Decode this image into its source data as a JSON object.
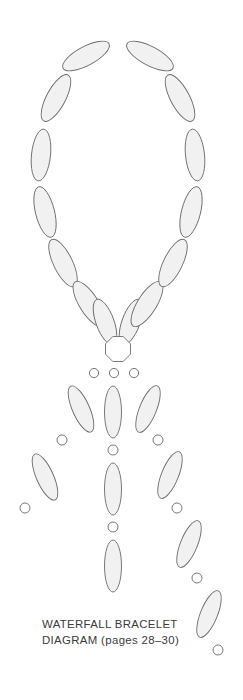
{
  "document": {
    "title": "Waterfall Bracelet Diagram",
    "background_color": "#ffffff",
    "width": 243,
    "height": 700
  },
  "caption": {
    "line1": "WATERFALL BRACELET",
    "line2": "DIAGRAM (pages 28–30)",
    "color": "#3b3b3b"
  },
  "style": {
    "bead_fill": "#f1f1f1",
    "bead_stroke": "#6b6b6b",
    "bead_stroke_width": 0.9,
    "seed_fill": "#ffffff",
    "seed_stroke": "#6b6b6b",
    "seed_stroke_width": 0.9,
    "clasp_fill": "#ffffff",
    "clasp_stroke": "#6b6b6b",
    "clasp_stroke_width": 0.9
  },
  "diagram": {
    "name": "waterfall-bracelet",
    "loop": {
      "name": "teardrop-loop",
      "bead_count": 14,
      "beads": [
        {
          "cx": 86,
          "cy": 56,
          "rx": 9.5,
          "ry": 26,
          "angle": 62
        },
        {
          "cx": 56,
          "cy": 98,
          "rx": 9.5,
          "ry": 26,
          "angle": 28
        },
        {
          "cx": 41,
          "cy": 155,
          "rx": 9.5,
          "ry": 26,
          "angle": 6
        },
        {
          "cx": 45,
          "cy": 212,
          "rx": 9.5,
          "ry": 26,
          "angle": -14
        },
        {
          "cx": 63,
          "cy": 263,
          "rx": 9.5,
          "ry": 26,
          "angle": -26
        },
        {
          "cx": 89,
          "cy": 304,
          "rx": 9.5,
          "ry": 26,
          "angle": -32
        },
        {
          "cx": 105,
          "cy": 322,
          "rx": 9.0,
          "ry": 24,
          "angle": -20
        },
        {
          "cx": 131,
          "cy": 322,
          "rx": 9.0,
          "ry": 24,
          "angle": 20
        },
        {
          "cx": 147,
          "cy": 304,
          "rx": 9.5,
          "ry": 26,
          "angle": 32
        },
        {
          "cx": 173,
          "cy": 263,
          "rx": 9.5,
          "ry": 26,
          "angle": 26
        },
        {
          "cx": 191,
          "cy": 212,
          "rx": 9.5,
          "ry": 26,
          "angle": 14
        },
        {
          "cx": 195,
          "cy": 155,
          "rx": 9.5,
          "ry": 26,
          "angle": -6
        },
        {
          "cx": 180,
          "cy": 98,
          "rx": 9.5,
          "ry": 26,
          "angle": -28
        },
        {
          "cx": 150,
          "cy": 56,
          "rx": 9.5,
          "ry": 26,
          "angle": -62
        }
      ]
    },
    "clasp": {
      "name": "octagon-clasp-bead",
      "cx": 118,
      "cy": 349,
      "radius": 13.5,
      "sides": 8,
      "rotation": 22.5
    },
    "strands": [
      {
        "name": "left-strand",
        "seed_top": {
          "cx": 94,
          "cy": 373,
          "r": 4.6
        },
        "items": [
          {
            "type": "bead",
            "cx": 81,
            "cy": 409,
            "rx": 8.5,
            "ry": 25,
            "angle": -24
          },
          {
            "type": "seed",
            "cx": 62,
            "cy": 440,
            "r": 5.0
          },
          {
            "type": "bead",
            "cx": 45,
            "cy": 477,
            "rx": 8.5,
            "ry": 25,
            "angle": -24
          },
          {
            "type": "seed",
            "cx": 25,
            "cy": 508,
            "r": 5.0
          }
        ]
      },
      {
        "name": "center-strand",
        "seed_top": {
          "cx": 114,
          "cy": 373,
          "r": 4.6
        },
        "items": [
          {
            "type": "bead",
            "cx": 113,
            "cy": 412,
            "rx": 8.5,
            "ry": 26,
            "angle": 0
          },
          {
            "type": "seed",
            "cx": 113,
            "cy": 450,
            "r": 5.0
          },
          {
            "type": "bead",
            "cx": 113,
            "cy": 489,
            "rx": 8.5,
            "ry": 26,
            "angle": 0
          },
          {
            "type": "seed",
            "cx": 113,
            "cy": 527,
            "r": 5.0
          },
          {
            "type": "bead",
            "cx": 113,
            "cy": 566,
            "rx": 8.5,
            "ry": 26,
            "angle": 0
          }
        ]
      },
      {
        "name": "right-strand",
        "seed_top": {
          "cx": 134,
          "cy": 373,
          "r": 4.6
        },
        "items": [
          {
            "type": "bead",
            "cx": 148,
            "cy": 409,
            "rx": 8.5,
            "ry": 25,
            "angle": 22
          },
          {
            "type": "seed",
            "cx": 158,
            "cy": 440,
            "r": 5.0
          },
          {
            "type": "bead",
            "cx": 170,
            "cy": 475,
            "rx": 8.5,
            "ry": 25,
            "angle": 22
          },
          {
            "type": "seed",
            "cx": 177,
            "cy": 508,
            "r": 5.0
          },
          {
            "type": "bead",
            "cx": 189,
            "cy": 544,
            "rx": 8.5,
            "ry": 25,
            "angle": 22
          },
          {
            "type": "seed",
            "cx": 197,
            "cy": 578,
            "r": 5.0
          },
          {
            "type": "bead",
            "cx": 209,
            "cy": 614,
            "rx": 8.5,
            "ry": 25,
            "angle": 22
          },
          {
            "type": "seed",
            "cx": 218,
            "cy": 650,
            "r": 5.0
          }
        ]
      }
    ]
  }
}
